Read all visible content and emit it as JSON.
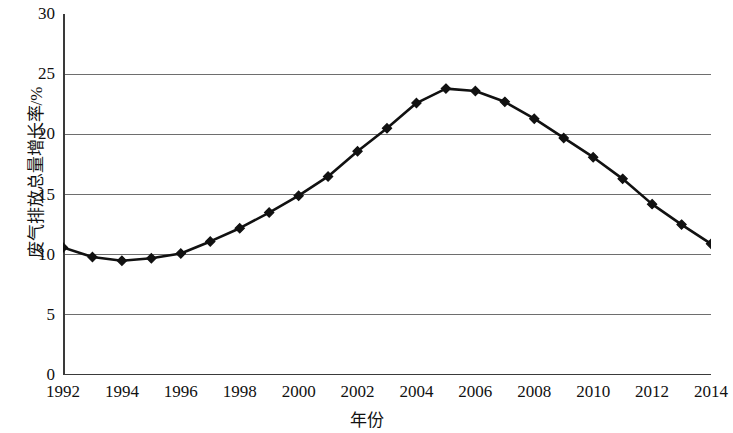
{
  "chart_data": {
    "type": "line",
    "title": "",
    "xlabel": "年份",
    "ylabel": "废气排放总量增长率/%",
    "x": [
      1992,
      1993,
      1994,
      1995,
      1996,
      1997,
      1998,
      1999,
      2000,
      2001,
      2002,
      2003,
      2004,
      2005,
      2006,
      2007,
      2008,
      2009,
      2010,
      2011,
      2012,
      2013,
      2014
    ],
    "values": [
      10.6,
      9.8,
      9.5,
      9.7,
      10.1,
      11.1,
      12.2,
      13.5,
      14.9,
      16.5,
      18.6,
      20.5,
      22.6,
      23.8,
      23.6,
      22.7,
      21.3,
      19.7,
      18.1,
      16.3,
      14.2,
      12.5,
      10.9
    ],
    "series": [
      {
        "name": "废气排放总量增长率",
        "values": [
          10.6,
          9.8,
          9.5,
          9.7,
          10.1,
          11.1,
          12.2,
          13.5,
          14.9,
          16.5,
          18.6,
          20.5,
          22.6,
          23.8,
          23.6,
          22.7,
          21.3,
          19.7,
          18.1,
          16.3,
          14.2,
          12.5,
          10.9
        ]
      }
    ],
    "xlim": [
      1992,
      2014
    ],
    "ylim": [
      0,
      30
    ],
    "ytick_labels": [
      "0",
      "5",
      "10",
      "15",
      "20",
      "25",
      "30"
    ],
    "ytick_values": [
      0,
      5,
      10,
      15,
      20,
      25,
      30
    ],
    "xtick_labels": [
      "1992",
      "1994",
      "1996",
      "1998",
      "2000",
      "2002",
      "2004",
      "2006",
      "2008",
      "2010",
      "2012",
      "2014"
    ],
    "xtick_values": [
      1992,
      1994,
      1996,
      1998,
      2000,
      2002,
      2004,
      2006,
      2008,
      2010,
      2012,
      2014
    ],
    "grid": "horizontal",
    "gridline_values": [
      5,
      10,
      15,
      20,
      25
    ],
    "legend": "none",
    "marker": "diamond",
    "line_color": "#111111",
    "marker_color": "#111111",
    "grid_color": "#6e6e6e",
    "axis_color": "#3a3a3a",
    "background_color": "#ffffff"
  }
}
